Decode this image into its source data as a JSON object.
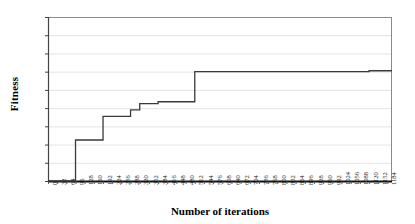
{
  "chart_data": {
    "type": "line",
    "title": "",
    "xlabel": "Number of iterations",
    "ylabel": "Fitness",
    "xlim": [
      0,
      1200
    ],
    "ylim": [
      0,
      1.8
    ],
    "grid": true,
    "legend": "none",
    "line_color": "#3a3a3a",
    "ytick_labels": [
      "0",
      "0,2",
      "0,4",
      "0,6",
      "0,8",
      "1",
      "1,2",
      "1,4",
      "1,6",
      "1,8"
    ],
    "ytick_values": [
      0,
      0.2,
      0.4,
      0.6,
      0.8,
      1.0,
      1.2,
      1.4,
      1.6,
      1.8
    ],
    "xtick_labels": [
      "0",
      "32",
      "64",
      "96",
      "128",
      "160",
      "192",
      "224",
      "256",
      "288",
      "320",
      "352",
      "384",
      "416",
      "448",
      "480",
      "512",
      "544",
      "576",
      "608",
      "640",
      "672",
      "704",
      "736",
      "768",
      "800",
      "832",
      "864",
      "896",
      "928",
      "960",
      "992",
      "1024",
      "1056",
      "1088",
      "1120",
      "1152",
      "1184"
    ],
    "xtick_values": [
      0,
      32,
      64,
      96,
      128,
      160,
      192,
      224,
      256,
      288,
      320,
      352,
      384,
      416,
      448,
      480,
      512,
      544,
      576,
      608,
      640,
      672,
      704,
      736,
      768,
      800,
      832,
      864,
      896,
      928,
      960,
      992,
      1024,
      1056,
      1088,
      1120,
      1152,
      1184
    ],
    "series": [
      {
        "name": "Best fitness",
        "x": [
          0,
          96,
          96,
          192,
          192,
          288,
          288,
          320,
          320,
          384,
          384,
          512,
          512,
          1120,
          1120,
          1200
        ],
        "values": [
          0,
          0,
          0.45,
          0.45,
          0.71,
          0.71,
          0.78,
          0.78,
          0.85,
          0.85,
          0.87,
          0.87,
          1.2,
          1.2,
          1.21,
          1.21
        ]
      }
    ],
    "step_points": [
      {
        "iteration": 0,
        "fitness": 0
      },
      {
        "iteration": 96,
        "fitness": 0.45
      },
      {
        "iteration": 192,
        "fitness": 0.71
      },
      {
        "iteration": 288,
        "fitness": 0.78
      },
      {
        "iteration": 320,
        "fitness": 0.85
      },
      {
        "iteration": 384,
        "fitness": 0.87
      },
      {
        "iteration": 512,
        "fitness": 1.2
      },
      {
        "iteration": 1120,
        "fitness": 1.21
      }
    ]
  }
}
